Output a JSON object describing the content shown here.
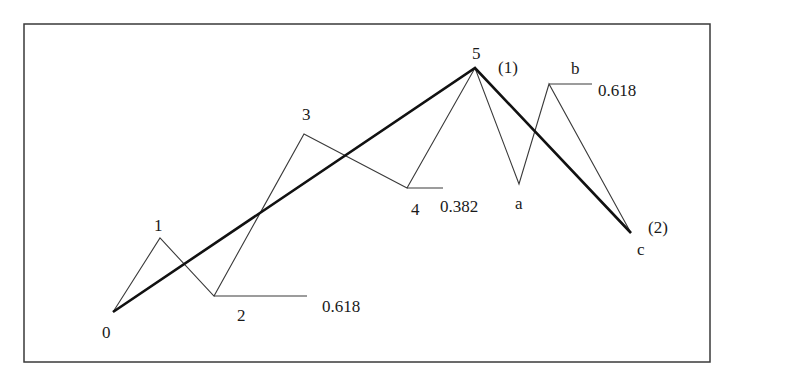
{
  "diagram": {
    "colors": {
      "background": "#ffffff",
      "frame": "#3a3a3a",
      "wave_line": "#3a3a3a",
      "trend_line": "#111111",
      "text": "#1a1a1a"
    },
    "frame": {
      "x": 24,
      "y": 24,
      "width": 686,
      "height": 338
    },
    "points": [
      {
        "id": "0",
        "x": 113,
        "y": 312
      },
      {
        "id": "1",
        "x": 160,
        "y": 238
      },
      {
        "id": "2",
        "x": 214,
        "y": 296
      },
      {
        "id": "3",
        "x": 304,
        "y": 134
      },
      {
        "id": "4",
        "x": 407,
        "y": 188
      },
      {
        "id": "5",
        "x": 475,
        "y": 68
      },
      {
        "id": "a",
        "x": 519,
        "y": 184
      },
      {
        "id": "b",
        "x": 549,
        "y": 84
      },
      {
        "id": "c",
        "x": 631,
        "y": 233
      }
    ],
    "wave_path": "113,312 160,238 214,296 304,134 407,188 475,68 519,184 549,84 631,233",
    "trend_path": "113,312 475,68 631,233",
    "labels": {
      "wave0": "0",
      "wave1": "1",
      "wave2": "2",
      "wave3": "3",
      "wave4": "4",
      "wave5": "5",
      "waveA": "a",
      "waveB": "b",
      "waveC": "c",
      "degree1": "(1)",
      "degree2": "(2)"
    },
    "fib_levels": [
      {
        "from_point": "2",
        "value": "0.618",
        "x1": 214,
        "x2": 307,
        "y": 296
      },
      {
        "from_point": "4",
        "value": "0.382",
        "x1": 407,
        "x2": 443,
        "y": 188
      },
      {
        "from_point": "b",
        "value": "0.618",
        "x1": 549,
        "x2": 592,
        "y": 84
      }
    ]
  }
}
